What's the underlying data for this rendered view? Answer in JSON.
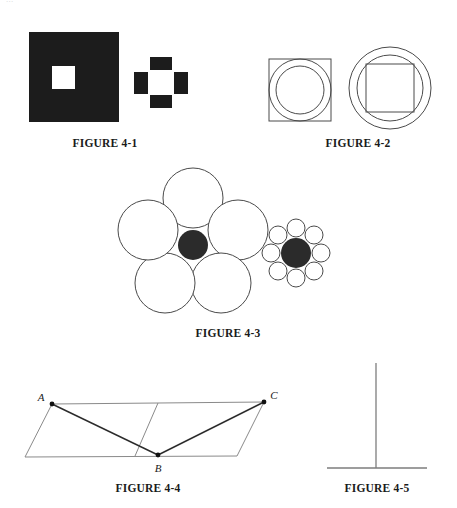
{
  "page": {
    "width": 457,
    "height": 508,
    "background": "#ffffff",
    "clipped_header_text": "..."
  },
  "colors": {
    "ink": "#1a1a1a",
    "stroke": "#4a4a4a",
    "fill_dark": "#2b2b2b",
    "fill_black": "#1c1c1c",
    "fill_white": "#ffffff",
    "caption": "#1a1a1a"
  },
  "figures": [
    {
      "id": "figure-4-1",
      "caption": "FIGURE 4-1",
      "caption_x": 105,
      "caption_y": 137,
      "description": "Simultaneous brightness / area contrast: a small white square on a large black square beside a small white square framed by four black bars",
      "shapes": {
        "large_black_square": {
          "x": 29,
          "y": 32,
          "size": 90,
          "fill": "#1c1c1c"
        },
        "inner_white_square_large": {
          "x": 52,
          "y": 66,
          "size": 23,
          "fill": "#ffffff"
        },
        "small_white_square": {
          "x": 150,
          "y": 72,
          "size": 22,
          "fill": "#ffffff"
        },
        "bars": [
          {
            "name": "top-bar",
            "x": 150,
            "y": 57,
            "w": 22,
            "h": 13
          },
          {
            "name": "bottom-bar",
            "x": 150,
            "y": 95,
            "w": 22,
            "h": 13
          },
          {
            "name": "left-bar",
            "x": 134,
            "y": 72,
            "w": 14,
            "h": 22
          },
          {
            "name": "right-bar",
            "x": 174,
            "y": 72,
            "w": 14,
            "h": 22
          }
        ]
      }
    },
    {
      "id": "figure-4-2",
      "caption": "FIGURE 4-2",
      "caption_x": 358,
      "caption_y": 137,
      "description": "Square with two concentric circles inside, next to two concentric circles with an inscribed square",
      "shapes": {
        "left_square": {
          "cx": 300,
          "cy": 90,
          "size": 62
        },
        "left_outer_circle": {
          "cx": 300,
          "cy": 90,
          "r": 31
        },
        "left_inner_circle": {
          "cx": 300,
          "cy": 90,
          "r": 24
        },
        "right_outer_circle": {
          "cx": 390,
          "cy": 88,
          "r": 41
        },
        "right_inner_circle": {
          "cx": 390,
          "cy": 88,
          "r": 33
        },
        "right_square": {
          "cx": 390,
          "cy": 88,
          "size": 48
        }
      }
    },
    {
      "id": "figure-4-3",
      "caption": "FIGURE 4-3",
      "caption_x": 228,
      "caption_y": 327,
      "description": "Ebbinghaus (Titchener) illusion: identical dark centre circles surrounded by five large circles and by eight small circles",
      "shapes": {
        "left_center": {
          "cx": 193,
          "cy": 245,
          "r": 15,
          "fill": "#2b2b2b"
        },
        "left_surround_r": 30,
        "left_surround_dist": 47,
        "left_surround_count": 5,
        "right_center": {
          "cx": 296,
          "cy": 253,
          "r": 15,
          "fill": "#2b2b2b"
        },
        "right_surround_r": 9,
        "right_surround_dist": 25,
        "right_surround_count": 8
      }
    },
    {
      "id": "figure-4-4",
      "caption": "FIGURE 4-4",
      "caption_x": 148,
      "caption_y": 482,
      "description": "Sander parallelogram illusion: parallelogram bisected with diagonals A-B and B-C",
      "points": {
        "A": {
          "x": 52,
          "y": 404,
          "label": "A",
          "label_x": 41,
          "label_y": 399
        },
        "B": {
          "x": 158,
          "y": 455,
          "label": "B",
          "label_x": 156,
          "label_y": 472
        },
        "C": {
          "x": 264,
          "y": 402,
          "label": "C",
          "label_x": 272,
          "label_y": 398
        }
      },
      "outline": [
        {
          "x": 52,
          "y": 404
        },
        {
          "x": 264,
          "y": 402
        },
        {
          "x": 237,
          "y": 456
        },
        {
          "x": 25,
          "y": 457
        }
      ],
      "inner_divider": [
        {
          "x": 158,
          "y": 404
        },
        {
          "x": 135,
          "y": 456
        }
      ]
    },
    {
      "id": "figure-4-5",
      "caption": "FIGURE 4-5",
      "caption_x": 377,
      "caption_y": 482,
      "description": "Horizontal-vertical illusion: an inverted T of two equal-length lines",
      "shapes": {
        "vertical_line": {
          "x": 376,
          "y1": 363,
          "y2": 468
        },
        "horizontal_line": {
          "y": 468,
          "x1": 327,
          "x2": 427
        }
      }
    }
  ]
}
